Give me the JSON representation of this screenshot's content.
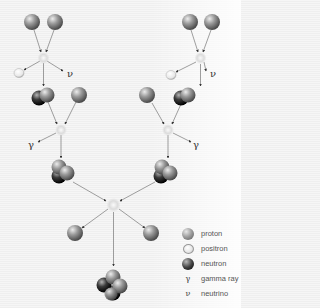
{
  "diagram": {
    "symbols": {
      "neutrino": "ν",
      "gamma": "γ"
    },
    "colors": {
      "proton": "#8c8c8c",
      "neutron": "#222222",
      "positron": "#f2f2f2",
      "arrow": "#666666"
    },
    "stages": [
      {
        "step": 1,
        "inputs": [
          "proton",
          "proton"
        ],
        "outputs": [
          "positron",
          "neutrino",
          "deuterium"
        ],
        "count": 2
      },
      {
        "step": 2,
        "inputs": [
          "deuterium",
          "proton"
        ],
        "outputs": [
          "gamma ray",
          "helium-3"
        ],
        "count": 2
      },
      {
        "step": 3,
        "inputs": [
          "helium-3",
          "helium-3"
        ],
        "outputs": [
          "proton",
          "proton",
          "helium-4"
        ],
        "count": 1
      }
    ]
  },
  "legend": {
    "items": [
      {
        "icon": "proton",
        "label": "proton"
      },
      {
        "icon": "positron",
        "label": "positron"
      },
      {
        "icon": "neutron",
        "label": "neutron"
      },
      {
        "icon": "gamma",
        "glyph": "γ",
        "label": "gamma ray"
      },
      {
        "icon": "neutrino",
        "glyph": "ν",
        "label": "neutrino"
      }
    ]
  }
}
